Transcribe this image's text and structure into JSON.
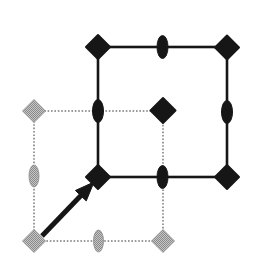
{
  "figure": {
    "canvas": {
      "width": 266,
      "height": 276,
      "background": "#ffffff"
    },
    "colors": {
      "black": "#161616",
      "gray_fill_light": "#c6c6c6",
      "gray_fill_dark": "#8a8a8a",
      "gray_line": "#9a9a9a"
    },
    "squares": [
      {
        "name": "gray-square",
        "color": "gray",
        "line_style": "dotted",
        "x1": 34,
        "y1": 111,
        "x2": 163,
        "y2": 241,
        "stroke_width": 2
      },
      {
        "name": "black-square",
        "color": "black",
        "line_style": "solid",
        "x1": 98,
        "y1": 47,
        "x2": 227,
        "y2": 177,
        "stroke_width": 2.6
      }
    ],
    "markers": [
      {
        "name": "gray-diamond-top-left",
        "type": "diamond",
        "color": "gray",
        "x": 34,
        "y": 111,
        "r": 11.5
      },
      {
        "name": "gray-diamond-bottom-left",
        "type": "diamond",
        "color": "gray",
        "x": 34,
        "y": 241,
        "r": 11.5
      },
      {
        "name": "gray-diamond-bottom-right",
        "type": "diamond",
        "color": "gray",
        "x": 163,
        "y": 241,
        "r": 11.5
      },
      {
        "name": "gray-ellipse-left-mid",
        "type": "ellipse",
        "color": "gray",
        "x": 34,
        "y": 176,
        "rx": 5,
        "ry": 11
      },
      {
        "name": "gray-ellipse-bottom-mid",
        "type": "ellipse",
        "color": "gray",
        "x": 98.5,
        "y": 241,
        "rx": 5,
        "ry": 11
      },
      {
        "name": "black-ellipse-top-mid",
        "type": "ellipse",
        "color": "black",
        "x": 162.5,
        "y": 47,
        "rx": 5.5,
        "ry": 11.5
      },
      {
        "name": "black-ellipse-left-mid",
        "type": "ellipse",
        "color": "black",
        "x": 98,
        "y": 111,
        "rx": 5.5,
        "ry": 11.5
      },
      {
        "name": "black-ellipse-right-mid",
        "type": "ellipse",
        "color": "black",
        "x": 227,
        "y": 112,
        "rx": 5.5,
        "ry": 11.5
      },
      {
        "name": "black-ellipse-bottom-mid",
        "type": "ellipse",
        "color": "black",
        "x": 162.5,
        "y": 177,
        "rx": 5.5,
        "ry": 11.5
      },
      {
        "name": "black-diamond-top-left",
        "type": "diamond",
        "color": "black",
        "x": 98,
        "y": 47,
        "r": 12
      },
      {
        "name": "black-diamond-top-right",
        "type": "diamond",
        "color": "black",
        "x": 227,
        "y": 47.5,
        "r": 12
      },
      {
        "name": "black-diamond-center",
        "type": "diamond",
        "color": "black",
        "x": 163,
        "y": 110.5,
        "r": 12.5
      },
      {
        "name": "black-diamond-bottom-left",
        "type": "diamond",
        "color": "black",
        "x": 98,
        "y": 177,
        "r": 12
      },
      {
        "name": "black-diamond-bottom-right",
        "type": "diamond",
        "color": "black",
        "x": 227,
        "y": 177,
        "r": 12
      }
    ],
    "arrow": {
      "name": "translation-arrow",
      "color": "black",
      "tail": [
        42,
        236
      ],
      "tip": [
        94,
        182
      ],
      "shaft_width": 5,
      "head_length": 19,
      "head_half_width": 7.5
    }
  }
}
